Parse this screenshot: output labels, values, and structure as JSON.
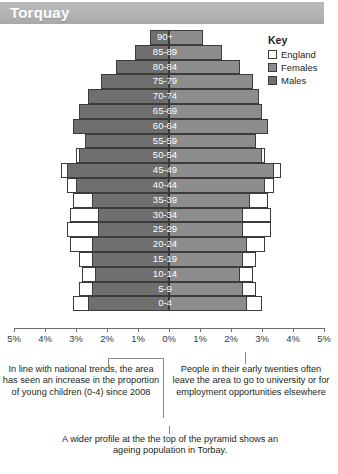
{
  "header": {
    "title": "Torquay"
  },
  "key": {
    "title": "Key",
    "items": [
      {
        "label": "England",
        "color": "#ffffff",
        "icon": "square-outline-icon"
      },
      {
        "label": "Females",
        "color": "#8d8d8d",
        "icon": "square-filled-icon"
      },
      {
        "label": "Males",
        "color": "#6f6f6f",
        "icon": "square-filled-icon"
      }
    ]
  },
  "annotations": {
    "left": "In line with national trends, the area has seen an increase in the proportion of young children (0-4) since 2008",
    "right": "People in their early twenties often leave the area to go to university or for employment opportunities elsewhere",
    "bottom": "A wider profile at the the top of the pyramid shows an ageing population in Torbay."
  },
  "chart_data": {
    "type": "bar",
    "title": "Torquay",
    "subtitle": "Population pyramid by age band, percentage of total population",
    "xlabel": "",
    "ylabel": "Age band",
    "orientation": "horizontal-diverging",
    "xlim": [
      -5,
      5
    ],
    "xticks": [
      -5,
      -4,
      -3,
      -2,
      -1,
      0,
      1,
      2,
      3,
      4,
      5
    ],
    "xticklabels": [
      "5%",
      "4%",
      "3%",
      "2%",
      "1%",
      "0%",
      "1%",
      "2%",
      "3%",
      "4%",
      "5%"
    ],
    "grid": false,
    "legend_position": "top-right",
    "categories": [
      "90+",
      "85-89",
      "80-84",
      "75-79",
      "70-74",
      "65-69",
      "60-64",
      "55-59",
      "50-54",
      "45-49",
      "40-44",
      "35-39",
      "30-34",
      "25-29",
      "20-24",
      "15-19",
      "10-14",
      "5-9",
      "0-4"
    ],
    "series": [
      {
        "name": "Males",
        "side": "left",
        "color": "#6f6f6f",
        "values": [
          0.6,
          1.1,
          1.7,
          2.2,
          2.6,
          2.9,
          3.1,
          2.7,
          2.9,
          3.3,
          3.0,
          2.5,
          2.3,
          2.3,
          2.5,
          2.5,
          2.4,
          2.5,
          2.6
        ]
      },
      {
        "name": "Females",
        "side": "right",
        "color": "#8d8d8d",
        "values": [
          1.1,
          1.7,
          2.3,
          2.7,
          2.9,
          3.0,
          3.2,
          2.8,
          3.0,
          3.4,
          3.1,
          2.6,
          2.4,
          2.4,
          2.5,
          2.4,
          2.3,
          2.4,
          2.5
        ]
      },
      {
        "name": "England (males)",
        "side": "left",
        "color": "#ffffff",
        "values": [
          0.5,
          0.9,
          1.4,
          1.8,
          2.2,
          2.5,
          2.7,
          2.6,
          3.0,
          3.5,
          3.3,
          3.1,
          3.2,
          3.3,
          3.2,
          2.9,
          2.8,
          2.9,
          3.1
        ]
      },
      {
        "name": "England (females)",
        "side": "right",
        "color": "#ffffff",
        "values": [
          1.0,
          1.5,
          2.0,
          2.3,
          2.5,
          2.7,
          2.8,
          2.7,
          3.1,
          3.6,
          3.4,
          3.2,
          3.3,
          3.3,
          3.1,
          2.8,
          2.7,
          2.8,
          3.0
        ]
      }
    ]
  }
}
